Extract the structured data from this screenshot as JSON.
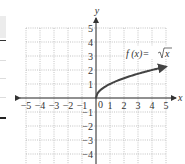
{
  "chart_data": {
    "type": "line",
    "title": "",
    "function_label": "f(x) = √x",
    "xlabel": "x",
    "ylabel": "y",
    "xlim": [
      -5,
      5
    ],
    "ylim": [
      -4,
      5
    ],
    "grid": true,
    "x_ticks": [
      -5,
      -4,
      -3,
      -2,
      -1,
      0,
      1,
      2,
      3,
      4,
      5
    ],
    "y_ticks": [
      -4,
      -3,
      -2,
      -1,
      1,
      2,
      3,
      4,
      5
    ],
    "series": [
      {
        "name": "f(x) = √x",
        "x": [
          0,
          0.25,
          0.5,
          1,
          1.5,
          2,
          2.5,
          3,
          3.5,
          4,
          4.5,
          5
        ],
        "y": [
          0,
          0.5,
          0.707,
          1,
          1.225,
          1.414,
          1.581,
          1.732,
          1.871,
          2,
          2.121,
          2.236
        ],
        "end_arrow": true
      }
    ]
  },
  "labels": {
    "x_axis": "x",
    "y_axis": "y",
    "origin": "0",
    "f_part": "f (x)=",
    "sqrt_arg": "x",
    "x_tick_labels": [
      "−5",
      "−4",
      "−3",
      "−2",
      "−1",
      "1",
      "2",
      "3",
      "4",
      "5"
    ],
    "y_tick_labels_pos": [
      "1",
      "2",
      "3",
      "4",
      "5"
    ],
    "y_tick_labels_neg": [
      "−1",
      "−2",
      "−3",
      "−4"
    ]
  }
}
